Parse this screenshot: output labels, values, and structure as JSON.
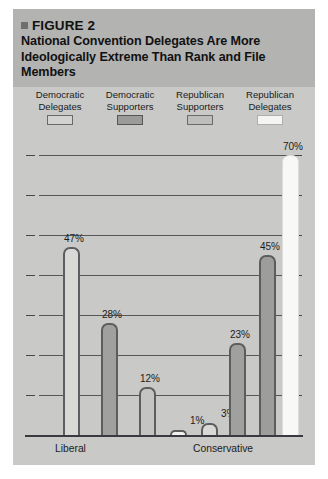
{
  "figure": {
    "bullet_icon": "square-bullet-icon",
    "number_label": "FIGURE 2",
    "title": "National Convention Delegates Are More Ideologically Extreme Than Rank and File Members"
  },
  "legend": {
    "items": [
      {
        "line1": "Democratic",
        "line2": "Delegates",
        "swatch": "#d2d2d0",
        "swatch_border": "#6a6a69"
      },
      {
        "line1": "Democratic",
        "line2": "Supporters",
        "swatch": "#9b9b99",
        "swatch_border": "#555554"
      },
      {
        "line1": "Republican",
        "line2": "Supporters",
        "swatch": "#bdbdbb",
        "swatch_border": "#6a6a69"
      },
      {
        "line1": "Republican",
        "line2": "Delegates",
        "swatch": "#f4f4f2",
        "swatch_border": "#aeaeac"
      }
    ]
  },
  "chart_data": {
    "type": "bar",
    "title": "National Convention Delegates Are More Ideologically Extreme Than Rank and File Members",
    "xlabel": "",
    "ylabel": "",
    "ylim": [
      0,
      70
    ],
    "grid": true,
    "gridline_values": [
      10,
      20,
      30,
      40,
      50,
      60,
      70
    ],
    "tick_values": [
      0,
      10,
      20,
      30,
      40,
      50,
      60,
      70
    ],
    "axis_tick_labels_shown": false,
    "legend_position": "top",
    "categories": [
      "Liberal",
      "Conservative"
    ],
    "series": [
      {
        "name": "Democratic Delegates",
        "values": [
          47,
          null
        ],
        "fill": "#d8d8d6"
      },
      {
        "name": "Democratic Supporters",
        "values": [
          28,
          null
        ],
        "fill": "#a0a09e"
      },
      {
        "name": "Republican Supporters",
        "values": [
          12,
          null
        ],
        "fill": "#c4c4c2"
      },
      {
        "name": "Republican Delegates",
        "values": [
          1,
          null
        ],
        "fill": "#f2f2f0"
      },
      {
        "name": "Democratic Delegates",
        "values": [
          null,
          3
        ],
        "fill": "#d8d8d6"
      },
      {
        "name": "Democratic Supporters",
        "values": [
          null,
          23
        ],
        "fill": "#a0a09e"
      },
      {
        "name": "Republican Supporters",
        "values": [
          null,
          45
        ],
        "fill": "#9d9d9b"
      },
      {
        "name": "Republican Delegates",
        "values": [
          null,
          70
        ],
        "fill": "#f8f8f6"
      }
    ],
    "bars": [
      {
        "group": "Liberal",
        "series": "Democratic Delegates",
        "value": 47,
        "label": "47%"
      },
      {
        "group": "Liberal",
        "series": "Democratic Supporters",
        "value": 28,
        "label": "28%"
      },
      {
        "group": "Liberal",
        "series": "Republican Supporters",
        "value": 12,
        "label": "12%"
      },
      {
        "group": "Liberal",
        "series": "Republican Delegates",
        "value": 1,
        "label": "1%"
      },
      {
        "group": "Conservative",
        "series": "Democratic Delegates",
        "value": 3,
        "label": "3%"
      },
      {
        "group": "Conservative",
        "series": "Democratic Supporters",
        "value": 23,
        "label": "23%"
      },
      {
        "group": "Conservative",
        "series": "Republican Supporters",
        "value": 45,
        "label": "45%"
      },
      {
        "group": "Conservative",
        "series": "Republican Delegates",
        "value": 70,
        "label": "70%"
      }
    ]
  },
  "axis": {
    "category_labels": [
      "Liberal",
      "Conservative"
    ]
  },
  "colors": {
    "panel_background": "#c9c9c7",
    "title_band": "#b3b3b1",
    "gridline": "#56565a",
    "baseline": "#3a3a3e",
    "bar_outline": "#5d5d5f",
    "text": "#1b1b1b"
  }
}
